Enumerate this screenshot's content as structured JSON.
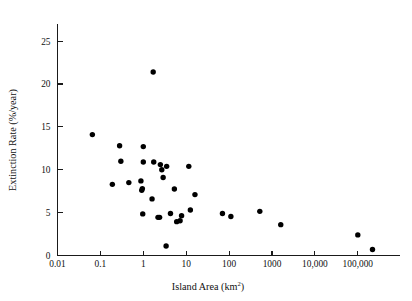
{
  "chart_data": {
    "type": "scatter",
    "title": "",
    "xlabel": "Island Area (km2)",
    "xlabel_base": "Island Area (km",
    "xlabel_sup": "2",
    "xlabel_close": ")",
    "ylabel": "Extinction Rate (%/year)",
    "xscale": "log",
    "yscale": "linear",
    "xlim": [
      0.01,
      400000
    ],
    "ylim": [
      0,
      27
    ],
    "grid": false,
    "legend": null,
    "xticks": [
      0.01,
      0.1,
      1,
      10,
      100,
      1000,
      10000,
      100000
    ],
    "xticklabels": [
      "0.01",
      "0.1",
      "1",
      "10",
      "100",
      "1000",
      "10,000",
      "100,000"
    ],
    "yticks": [
      0,
      5,
      10,
      15,
      20,
      25
    ],
    "yticklabels": [
      "0",
      "5",
      "10",
      "15",
      "20",
      "25"
    ],
    "marker": "filled-circle",
    "marker_color": "#000000",
    "marker_size": 4.6,
    "points": [
      {
        "x": 0.065,
        "y": 14.1
      },
      {
        "x": 0.19,
        "y": 8.3
      },
      {
        "x": 0.28,
        "y": 12.8
      },
      {
        "x": 0.3,
        "y": 11.0
      },
      {
        "x": 0.46,
        "y": 8.5
      },
      {
        "x": 0.88,
        "y": 8.7
      },
      {
        "x": 0.92,
        "y": 7.6
      },
      {
        "x": 0.95,
        "y": 7.8
      },
      {
        "x": 0.97,
        "y": 4.85
      },
      {
        "x": 1.0,
        "y": 12.7
      },
      {
        "x": 1.0,
        "y": 10.9
      },
      {
        "x": 1.6,
        "y": 6.6
      },
      {
        "x": 1.7,
        "y": 21.4
      },
      {
        "x": 1.75,
        "y": 10.9
      },
      {
        "x": 2.2,
        "y": 4.45
      },
      {
        "x": 2.4,
        "y": 4.45
      },
      {
        "x": 2.5,
        "y": 10.6
      },
      {
        "x": 2.7,
        "y": 10.0
      },
      {
        "x": 2.9,
        "y": 9.1
      },
      {
        "x": 3.4,
        "y": 1.1
      },
      {
        "x": 3.5,
        "y": 10.4
      },
      {
        "x": 4.3,
        "y": 4.9
      },
      {
        "x": 5.3,
        "y": 7.75
      },
      {
        "x": 6.0,
        "y": 3.95
      },
      {
        "x": 7.2,
        "y": 4.05
      },
      {
        "x": 7.8,
        "y": 4.65
      },
      {
        "x": 11.5,
        "y": 10.4
      },
      {
        "x": 12.5,
        "y": 5.3
      },
      {
        "x": 16.0,
        "y": 7.1
      },
      {
        "x": 70.0,
        "y": 4.9
      },
      {
        "x": 110.0,
        "y": 4.55
      },
      {
        "x": 520.0,
        "y": 5.15
      },
      {
        "x": 1600.0,
        "y": 3.6
      },
      {
        "x": 100000.0,
        "y": 2.4
      },
      {
        "x": 220000.0,
        "y": 0.7
      }
    ]
  }
}
